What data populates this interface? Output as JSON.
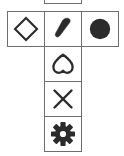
{
  "figure": {
    "background_color": "#ffffff",
    "cell_border_color": "#6e6e6e",
    "icon_stroke_color": "#2b2b2b",
    "icon_fill_color": "#2b2b2b",
    "layout": "T-tetromino: 3 cells across the top row, 3 more cells extending downward from the middle column",
    "columns": 3,
    "rows": 4,
    "cell_count": 6,
    "partial_cell_note": "a sixth cell is clipped by the top edge of the image above the middle column"
  },
  "cells": [
    {
      "id": "cell-partial",
      "row": -1,
      "column": 1,
      "icon_name": "clipped-cell",
      "icon_label": "",
      "icon_style": "empty",
      "visible": "partially clipped at top edge"
    },
    {
      "id": "cell-r0c0",
      "row": 0,
      "column": 0,
      "icon_name": "diamond-icon",
      "icon_label": "Diamond",
      "icon_style": "outline",
      "visible": "full"
    },
    {
      "id": "cell-r0c1",
      "row": 0,
      "column": 1,
      "icon_name": "cone-icon",
      "icon_label": "Cone",
      "icon_style": "filled",
      "visible": "full"
    },
    {
      "id": "cell-r0c2",
      "row": 0,
      "column": 2,
      "icon_name": "circle-icon",
      "icon_label": "Circle",
      "icon_style": "filled",
      "visible": "full"
    },
    {
      "id": "cell-r1c1",
      "row": 1,
      "column": 1,
      "icon_name": "heart-icon",
      "icon_label": "Heart (inverted)",
      "icon_style": "outline",
      "visible": "full"
    },
    {
      "id": "cell-r2c1",
      "row": 2,
      "column": 1,
      "icon_name": "close-x-icon",
      "icon_label": "X mark",
      "icon_style": "outline",
      "visible": "full"
    },
    {
      "id": "cell-r3c1",
      "row": 3,
      "column": 1,
      "icon_name": "gear-icon",
      "icon_label": "Gear",
      "icon_style": "filled",
      "visible": "full"
    }
  ]
}
